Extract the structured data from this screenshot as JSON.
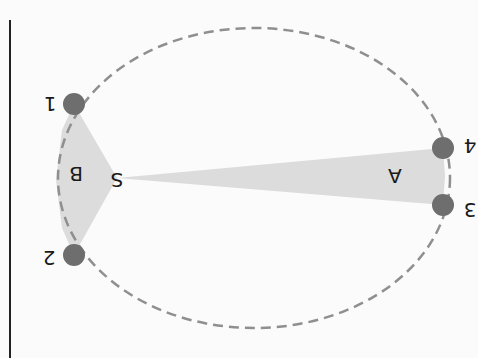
{
  "diagram": {
    "title": "",
    "orientation": "rotated-180",
    "colors": {
      "background": "#fbfbfb",
      "orbit_stroke": "#8f8f8f",
      "sector_fill": "#dcdcdc",
      "point_fill": "#6e6e6e",
      "axis_line": "#222222",
      "label": "#1a1a1a"
    },
    "sun_label": "S",
    "points": [
      {
        "id": "1",
        "label": "1"
      },
      {
        "id": "2",
        "label": "2"
      },
      {
        "id": "3",
        "label": "3"
      },
      {
        "id": "4",
        "label": "4"
      }
    ],
    "sectors": [
      {
        "label": "A",
        "from": "3",
        "to": "4"
      },
      {
        "label": "B",
        "from": "1",
        "to": "2"
      }
    ]
  }
}
